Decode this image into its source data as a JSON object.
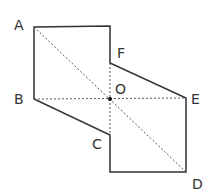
{
  "figure": {
    "labels": {
      "A": "A",
      "B": "B",
      "C": "C",
      "D": "D",
      "E": "E",
      "F": "F",
      "O": "O"
    },
    "points": {
      "A": [
        34,
        27
      ],
      "TR": [
        110,
        26
      ],
      "F": [
        110,
        63
      ],
      "E": [
        186,
        98
      ],
      "D": [
        186,
        172
      ],
      "BL": [
        110,
        172
      ],
      "C": [
        110,
        135
      ],
      "B": [
        34,
        99
      ],
      "O": [
        110,
        99
      ]
    },
    "colors": {
      "outline": "#333333",
      "dashed": "#555555",
      "text": "#333333"
    }
  }
}
